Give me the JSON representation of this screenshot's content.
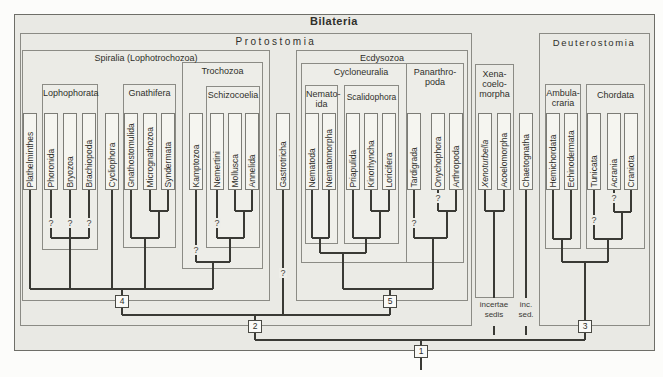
{
  "figure": {
    "title": "Bilateria"
  },
  "groups": {
    "protostomia": {
      "label": "Protostomia"
    },
    "spiralia": {
      "label": "Spiralia (Lophotrochozoa)"
    },
    "lophophorata": {
      "label": "Lophophorata"
    },
    "gnathifera": {
      "label": "Gnathifera"
    },
    "trochozoa": {
      "label": "Trochozoa"
    },
    "schizocoelia": {
      "label": "Schizocoelia"
    },
    "ecdysozoa": {
      "label": "Ecdysozoa"
    },
    "cycloneuralia": {
      "label": "Cycloneuralia"
    },
    "nematoida": {
      "lines": [
        "Nemato-",
        "ida"
      ]
    },
    "scalidophora": {
      "label": "Scalidophora"
    },
    "panarthropoda": {
      "lines": [
        "Panarthro-",
        "poda"
      ]
    },
    "xenacoelomorpha": {
      "lines": [
        "Xena-",
        "coelo-",
        "morpha"
      ]
    },
    "deuterostomia": {
      "label": "Deuterostomia"
    },
    "ambulacraria": {
      "lines": [
        "Ambula-",
        "craria"
      ]
    },
    "chordata": {
      "label": "Chordata"
    }
  },
  "taxa": {
    "plathelminthes": "Plathelminthes",
    "phoronida": "Phoronida",
    "bryozoa": "Bryozoa",
    "brachiopoda": "Brachiopoda",
    "cycliophora": "Cycliophora",
    "gnathostomulida": "Gnathostomulida",
    "micrognathozoa": "Micrognathozoa",
    "syndermata": "Syndermata",
    "kamptozoa": "Kamptozoa",
    "nemertini": "Nemertini",
    "mollusca": "Mollusca",
    "annelida": "Annelida",
    "gastrotricha": "Gastrotricha",
    "nematoda": "Nematoda",
    "nematomorpha": "Nematomorpha",
    "priapulida": "Priapulida",
    "kinorhyncha": "Kinorhyncha",
    "loricifera": "Loricifera",
    "tardigrada": "Tardigrada",
    "onychophora": "Onychophora",
    "arthropoda": "Arthropoda",
    "xenoturbella": "Xenoturbella",
    "acoelomorpha": "Acoelomorpha",
    "chaetognatha": "Chaetognatha",
    "hemichordata": "Hemichordata",
    "echinodermata": "Echinodermata",
    "tunicata": "Tunicata",
    "acrania": "Acrania",
    "craniota": "Craniota"
  },
  "nodes": {
    "n1": "1",
    "n2": "2",
    "n3": "3",
    "n4": "4",
    "n5": "5"
  },
  "annotations": {
    "incertae_sedis": {
      "lines": [
        "incertae",
        "sedis"
      ]
    },
    "inc_sed": {
      "lines": [
        "inc.",
        "sed."
      ]
    }
  },
  "uncertainty_mark": "?",
  "colors": {
    "page_background": "#fcfcfa",
    "figure_background": "#e9e9e4",
    "box_border": "#8b8b85",
    "taxon_fill": "#f5f5f0",
    "tree_line": "#3a3a35"
  }
}
